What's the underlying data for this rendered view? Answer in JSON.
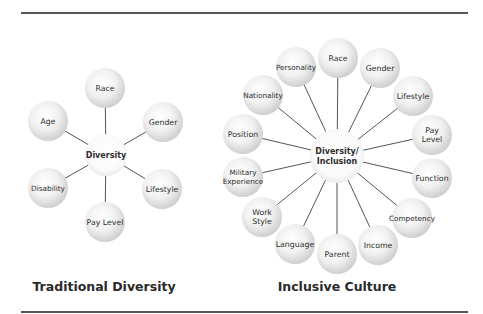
{
  "diagrams": [
    {
      "title": "Traditional Diversity",
      "title_pos": {
        "x": 104,
        "y": 279
      },
      "center": {
        "label": [
          "Diversity"
        ],
        "x": 106,
        "y": 155,
        "r": 21
      },
      "node_radius": 20,
      "nodes": [
        {
          "label": [
            "Race"
          ],
          "x": 105,
          "y": 88
        },
        {
          "label": [
            "Gender"
          ],
          "x": 163,
          "y": 122
        },
        {
          "label": [
            "Lifestyle"
          ],
          "x": 162,
          "y": 189
        },
        {
          "label": [
            "Pay Level"
          ],
          "x": 105,
          "y": 222
        },
        {
          "label": [
            "Disability"
          ],
          "x": 48,
          "y": 188
        },
        {
          "label": [
            "Age"
          ],
          "x": 48,
          "y": 121
        }
      ]
    },
    {
      "title": "Inclusive Culture",
      "title_pos": {
        "x": 337,
        "y": 279
      },
      "center": {
        "label": [
          "Diversity/",
          "Inclusion"
        ],
        "x": 337,
        "y": 156,
        "r": 27
      },
      "node_radius": 20,
      "nodes": [
        {
          "label": [
            "Race"
          ],
          "x": 338,
          "y": 58
        },
        {
          "label": [
            "Gender"
          ],
          "x": 380,
          "y": 68
        },
        {
          "label": [
            "Lifestyle"
          ],
          "x": 413,
          "y": 96
        },
        {
          "label": [
            "Pay",
            "Level"
          ],
          "x": 432,
          "y": 135
        },
        {
          "label": [
            "Function"
          ],
          "x": 432,
          "y": 178
        },
        {
          "label": [
            "Competency"
          ],
          "x": 412,
          "y": 218
        },
        {
          "label": [
            "Income"
          ],
          "x": 378,
          "y": 245
        },
        {
          "label": [
            "Parent"
          ],
          "x": 337,
          "y": 254
        },
        {
          "label": [
            "Language"
          ],
          "x": 295,
          "y": 244
        },
        {
          "label": [
            "Work",
            "Style"
          ],
          "x": 262,
          "y": 217
        },
        {
          "label": [
            "Military",
            "Experience"
          ],
          "x": 243,
          "y": 177
        },
        {
          "label": [
            "Position"
          ],
          "x": 243,
          "y": 134
        },
        {
          "label": [
            "Nationality"
          ],
          "x": 263,
          "y": 95
        },
        {
          "label": [
            "Personality"
          ],
          "x": 296,
          "y": 67
        }
      ]
    }
  ],
  "colors": {
    "rule": "#555555",
    "connector": "#555555",
    "bubble_light": "#ffffff",
    "bubble_edge": "#cdcdcd",
    "text": "#2e2e2e"
  }
}
